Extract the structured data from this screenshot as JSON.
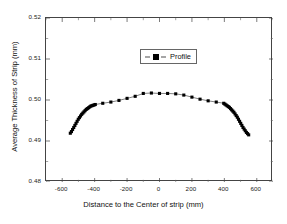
{
  "chart_data": {
    "type": "scatter",
    "title": "",
    "xlabel": "Distance to the Center of strip (mm)",
    "ylabel": "Average Thickness of Strip (mm)",
    "xlim": [
      -700,
      700
    ],
    "ylim": [
      0.48,
      0.52
    ],
    "xticks": [
      -600,
      -400,
      -200,
      0,
      200,
      400,
      600
    ],
    "xtick_labels": [
      "-600",
      "-400",
      "-200",
      "0",
      "200",
      "400",
      "600"
    ],
    "yticks": [
      0.48,
      0.49,
      0.5,
      0.51,
      0.52
    ],
    "ytick_labels": [
      "0.48",
      "0.49",
      "0.50",
      "0.51",
      "0.52"
    ],
    "x_minor_tick_interval": 100,
    "y_minor_tick_interval": 0.005,
    "grid": false,
    "legend_position": "upper-center",
    "marker": "square",
    "marker_color": "#000000",
    "line_color": "#000000",
    "series": [
      {
        "name": "Profile",
        "x": [
          -550,
          -543,
          -536,
          -529,
          -522,
          -515,
          -508,
          -501,
          -494,
          -487,
          -480,
          -473,
          -466,
          -459,
          -452,
          -445,
          -438,
          -431,
          -424,
          -417,
          -410,
          -403,
          -396,
          -350,
          -300,
          -250,
          -200,
          -150,
          -100,
          -50,
          0,
          50,
          100,
          150,
          200,
          250,
          300,
          350,
          396,
          403,
          410,
          417,
          424,
          431,
          438,
          445,
          452,
          459,
          466,
          473,
          480,
          487,
          494,
          501,
          508,
          515,
          522,
          529,
          536,
          543,
          550
        ],
        "y": [
          0.4919,
          0.4923,
          0.4928,
          0.4933,
          0.4938,
          0.4943,
          0.4948,
          0.4953,
          0.4957,
          0.4961,
          0.4965,
          0.4968,
          0.4971,
          0.4974,
          0.4977,
          0.4979,
          0.4981,
          0.4983,
          0.4985,
          0.4986,
          0.4987,
          0.4988,
          0.4989,
          0.4992,
          0.4995,
          0.4999,
          0.5004,
          0.5009,
          0.5016,
          0.5017,
          0.5016,
          0.5016,
          0.5015,
          0.5012,
          0.5007,
          0.5002,
          0.4998,
          0.4995,
          0.4992,
          0.499,
          0.4988,
          0.4986,
          0.4984,
          0.4982,
          0.4979,
          0.4976,
          0.4973,
          0.497,
          0.4966,
          0.4962,
          0.4958,
          0.4953,
          0.4948,
          0.4943,
          0.4938,
          0.4933,
          0.4929,
          0.4925,
          0.4921,
          0.4918,
          0.4915
        ]
      }
    ]
  },
  "legend": {
    "entries": [
      {
        "label": "Profile",
        "marker": "square",
        "color": "#000000"
      }
    ]
  },
  "axes": {
    "x_title": "Distance to the Center of strip (mm)",
    "y_title": "Average Thickness of Strip (mm)"
  }
}
